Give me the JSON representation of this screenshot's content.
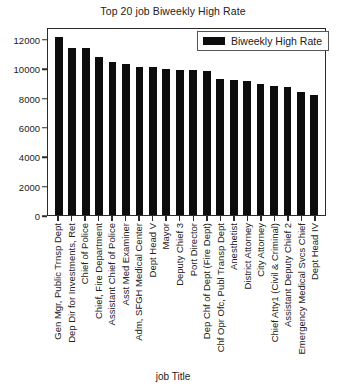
{
  "chart_data": {
    "type": "bar",
    "title": "Top 20 job Biweekly High Rate",
    "xlabel": "job Title",
    "ylabel": "",
    "ylim": [
      0,
      12800
    ],
    "yticks": [
      0,
      2000,
      4000,
      6000,
      8000,
      10000,
      12000
    ],
    "grid": false,
    "legend": {
      "position": "upper right",
      "entries": [
        "Biweekly High Rate"
      ]
    },
    "series": [
      {
        "name": "Biweekly High Rate",
        "color": "#0d0d0d",
        "values": [
          12100,
          11400,
          11350,
          10750,
          10450,
          10300,
          10100,
          10050,
          9950,
          9900,
          9850,
          9800,
          9250,
          9200,
          9150,
          8900,
          8800,
          8700,
          8350,
          8150
        ]
      }
    ],
    "categories": [
      "Gen Mgr, Public Trnsp Dept",
      "Dep Dir for Investments, Ret",
      "Chief of Police",
      "Chief, Fire Department",
      "Assistant Chief of Police",
      "Asst Med Examiner",
      "Adm, SFGH Medical Center",
      "Dept Head V",
      "Mayor",
      "Deputy Chief 3",
      "Port Director",
      "Dep Chf of Dept (Fire Dept)",
      "Chf Opr Ofc, Publ Transp Dept",
      "Anesthetist",
      "District Attorney",
      "City Attorney",
      "Chief Atty1 (Civil & Criminal)",
      "Assistant Deputy Chief 2",
      "Emergency Medical Svcs Chief",
      "Dept Head IV"
    ]
  }
}
